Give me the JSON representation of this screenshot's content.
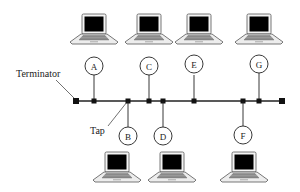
{
  "diagram": {
    "type": "bus-topology-network",
    "labels": {
      "terminator": "Terminator",
      "tap": "Tap"
    },
    "colors": {
      "line": "#222222",
      "screen": "#000000",
      "laptop_body": "#f2f2f2",
      "keyboard": "#8a8a8a",
      "outline": "#555555"
    },
    "bus": {
      "y": 101,
      "x_start": 76,
      "x_end": 282
    },
    "nodes": [
      {
        "id": "A",
        "side": "top",
        "x": 94
      },
      {
        "id": "B",
        "side": "bottom",
        "x": 128
      },
      {
        "id": "C",
        "side": "top",
        "x": 149
      },
      {
        "id": "D",
        "side": "bottom",
        "x": 163
      },
      {
        "id": "E",
        "side": "top",
        "x": 194
      },
      {
        "id": "F",
        "side": "bottom",
        "x": 243
      },
      {
        "id": "G",
        "side": "top",
        "x": 259
      }
    ]
  }
}
